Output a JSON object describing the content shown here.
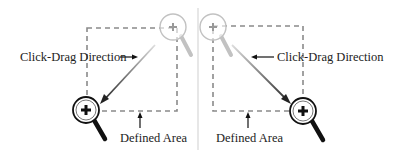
{
  "left_panel": {
    "direction_label": "Click-Drag Direction",
    "area_label": "Defined Area"
  },
  "right_panel": {
    "direction_label": "Click-Drag Direction",
    "area_label": "Defined Area"
  },
  "colors": {
    "dash": "#8a8a8a",
    "dark": "#111111",
    "faint": "#b5b5b5",
    "divider": "#cfcfcf"
  }
}
